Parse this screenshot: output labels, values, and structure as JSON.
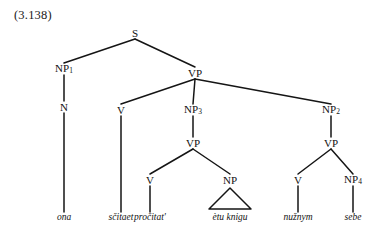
{
  "figure": {
    "example_number": "(3.138)",
    "type": "syntax-tree",
    "language": "Russian (transliterated)",
    "sentence_words": [
      "ona",
      "sčitaet",
      "pročitat'",
      "ètu knigu",
      "nužnym",
      "sebe"
    ],
    "line_color": "#151515",
    "text_color": "#121212",
    "background": "#ffffff"
  },
  "nodes": [
    {
      "id": "S",
      "label": "S",
      "sub": "",
      "x": 135,
      "y": 33,
      "kind": "nonterminal"
    },
    {
      "id": "NP1",
      "label": "NP",
      "sub": "1",
      "x": 64,
      "y": 69,
      "kind": "nonterminal"
    },
    {
      "id": "VP0",
      "label": "VP",
      "sub": "",
      "x": 195,
      "y": 73,
      "kind": "nonterminal"
    },
    {
      "id": "N1",
      "label": "N",
      "sub": "",
      "x": 64,
      "y": 107,
      "kind": "nonterminal"
    },
    {
      "id": "V1",
      "label": "V",
      "sub": "",
      "x": 121,
      "y": 110,
      "kind": "nonterminal"
    },
    {
      "id": "NP3",
      "label": "NP",
      "sub": "3",
      "x": 193,
      "y": 110,
      "kind": "nonterminal"
    },
    {
      "id": "NP2",
      "label": "NP",
      "sub": "2",
      "x": 331,
      "y": 110,
      "kind": "nonterminal"
    },
    {
      "id": "VP1",
      "label": "VP",
      "sub": "",
      "x": 193,
      "y": 143,
      "kind": "nonterminal"
    },
    {
      "id": "VP2",
      "label": "VP",
      "sub": "",
      "x": 331,
      "y": 143,
      "kind": "nonterminal"
    },
    {
      "id": "V2",
      "label": "V",
      "sub": "",
      "x": 150,
      "y": 180,
      "kind": "nonterminal"
    },
    {
      "id": "NP0",
      "label": "NP",
      "sub": "",
      "x": 230,
      "y": 180,
      "kind": "nonterminal"
    },
    {
      "id": "V3",
      "label": "V",
      "sub": "",
      "x": 298,
      "y": 180,
      "kind": "nonterminal"
    },
    {
      "id": "NP4",
      "label": "NP",
      "sub": "4",
      "x": 353,
      "y": 180,
      "kind": "nonterminal"
    }
  ],
  "terminals": [
    {
      "id": "T1",
      "text": "ona",
      "x": 64,
      "y": 218,
      "parent": "N1"
    },
    {
      "id": "T2",
      "text": "sčitaet",
      "x": 121,
      "y": 218,
      "parent": "V1"
    },
    {
      "id": "T3",
      "text": "pročitat'",
      "x": 150,
      "y": 218,
      "parent": "V2"
    },
    {
      "id": "T4",
      "text": "ètu knigu",
      "x": 230,
      "y": 218,
      "parent": "NP0"
    },
    {
      "id": "T5",
      "text": "nužnym",
      "x": 298,
      "y": 218,
      "parent": "V3"
    },
    {
      "id": "T6",
      "text": "sebe",
      "x": 353,
      "y": 218,
      "parent": "NP4"
    }
  ],
  "edges": [
    {
      "from": "S",
      "to": "NP1"
    },
    {
      "from": "S",
      "to": "VP0"
    },
    {
      "from": "NP1",
      "to": "N1"
    },
    {
      "from": "VP0",
      "to": "V1"
    },
    {
      "from": "VP0",
      "to": "NP3"
    },
    {
      "from": "VP0",
      "to": "NP2"
    },
    {
      "from": "NP3",
      "to": "VP1"
    },
    {
      "from": "NP2",
      "to": "VP2"
    },
    {
      "from": "VP1",
      "to": "V2"
    },
    {
      "from": "VP1",
      "to": "NP0"
    },
    {
      "from": "VP2",
      "to": "V3"
    },
    {
      "from": "VP2",
      "to": "NP4"
    },
    {
      "from": "N1",
      "to": "T1"
    },
    {
      "from": "V1",
      "to": "T2"
    },
    {
      "from": "V2",
      "to": "T3"
    },
    {
      "from": "V3",
      "to": "T5"
    },
    {
      "from": "NP4",
      "to": "T6"
    }
  ],
  "triangles": [
    {
      "parent": "NP0",
      "apex_x": 230,
      "apex_y": 188,
      "left_x": 209,
      "right_x": 251,
      "base_y": 209
    }
  ]
}
